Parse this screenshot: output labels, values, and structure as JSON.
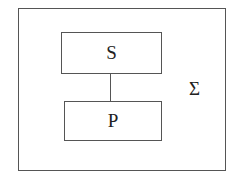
{
  "diagram": {
    "system_label": "Σ",
    "nodes": [
      {
        "id": "S",
        "label": "S"
      },
      {
        "id": "P",
        "label": "P"
      }
    ],
    "edges": [
      {
        "from": "S",
        "to": "P"
      }
    ],
    "colors": {
      "stroke": "#555555",
      "background": "#ffffff",
      "text": "#222222"
    }
  }
}
